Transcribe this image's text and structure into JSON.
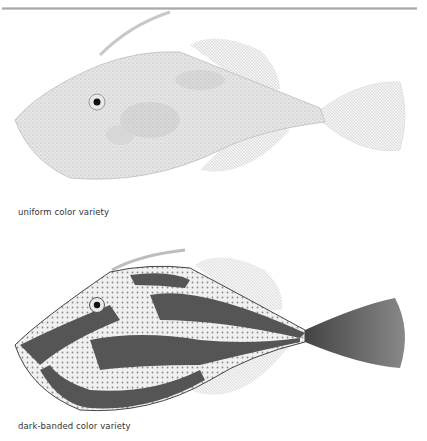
{
  "page": {
    "figures": [
      {
        "caption": "uniform color variety",
        "variant": "uniform",
        "body_color": "#e4e4e4",
        "shade_color": "#bdbdbd"
      },
      {
        "caption": "dark-banded color variety",
        "variant": "dark-banded",
        "body_color": "#eeeeee",
        "band_color": "#555555"
      }
    ],
    "colors": {
      "rule": "#a9a9a9",
      "fin": "#cfcfcf",
      "eye": "#111111",
      "text": "#333333"
    }
  }
}
